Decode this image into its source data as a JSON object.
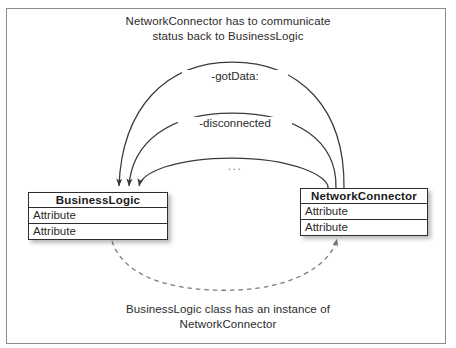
{
  "figure": {
    "background_color": "#ffffff",
    "frame_color": "#8c8c8c",
    "line_color": "#3a3a3a",
    "dashed_line_color": "#7a7a7a"
  },
  "captions": {
    "top": "NetworkConnector has to communicate\nstatus back to BusinessLogic",
    "bottom": "BusinessLogic class has an instance of\nNetworkConnector"
  },
  "messages": [
    {
      "label": "-gotData:"
    },
    {
      "label": "-disconnected"
    },
    {
      "label": "..."
    }
  ],
  "classes": [
    {
      "name": "BusinessLogic",
      "attributes": [
        "Attribute",
        "Attribute"
      ]
    },
    {
      "name": "NetworkConnector",
      "attributes": [
        "Attribute",
        "Attribute"
      ]
    }
  ],
  "relationship": {
    "style": "dashed",
    "from": "BusinessLogic",
    "to": "NetworkConnector",
    "description": "BusinessLogic class has an instance of NetworkConnector"
  }
}
